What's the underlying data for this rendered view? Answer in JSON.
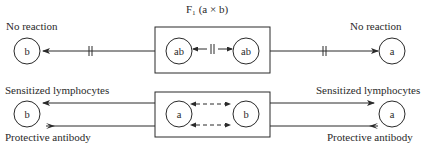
{
  "title": "F₁ (a × b)",
  "top_row": {
    "left_label": "No reaction",
    "right_label": "No reaction",
    "left_cell": "b",
    "box_cells": [
      "ab",
      "ab"
    ],
    "right_cell": "a",
    "relation": "blocked (||) in both directions"
  },
  "bottom_row": {
    "left_top_label": "Sensitized lymphocytes",
    "left_bottom_label": "Protective antibody",
    "right_top_label": "Sensitized lymphocytes",
    "right_bottom_label": "Protective antibody",
    "left_cell": "b",
    "box_cells": [
      "a",
      "b"
    ],
    "right_cell": "a",
    "relation": "dashed bidirectional arrows between a and b"
  },
  "colors": {
    "ink": "#2a2a2a",
    "background": "#ffffff"
  }
}
